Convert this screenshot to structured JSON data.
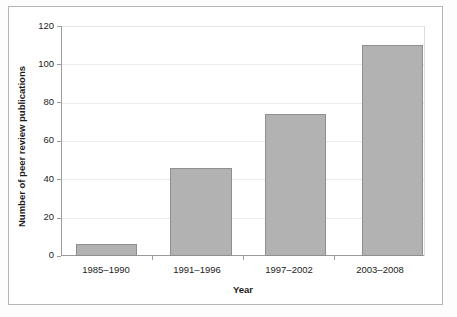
{
  "chart_data": {
    "type": "bar",
    "title": "",
    "categories": [
      "1985–1990",
      "1991–1996",
      "1997–2002",
      "2003–2008"
    ],
    "values": [
      6,
      46,
      74,
      110
    ],
    "series": [
      {
        "name": "Number of peer review publications",
        "values": [
          6,
          46,
          74,
          110
        ]
      }
    ],
    "xlabel": "Year",
    "ylabel": "Number of peer review publications",
    "ylim": [
      0,
      120
    ],
    "yticks": [
      0,
      20,
      40,
      60,
      80,
      100,
      120
    ],
    "ytick_labels": [
      "0",
      "20",
      "40",
      "60",
      "80",
      "100",
      "120"
    ],
    "grid": true,
    "legend": false,
    "legend_position": "none",
    "colors": {
      "bar_fill": "#b2b2b2",
      "bar_border": "#8f8f8f",
      "gridline": "#ececec",
      "axis": "#9b9b9b",
      "text": "#1c1c1c",
      "frame": "#b6b6b6",
      "background": "#ffffff"
    }
  },
  "axes": {
    "y_title": "Number of peer review publications",
    "x_title": "Year",
    "y_tick_labels": [
      "120",
      "100",
      "80",
      "60",
      "40",
      "20",
      "0"
    ],
    "x_tick_labels": [
      "1985–1990",
      "1991–1996",
      "1997–2002",
      "2003–2008"
    ]
  }
}
